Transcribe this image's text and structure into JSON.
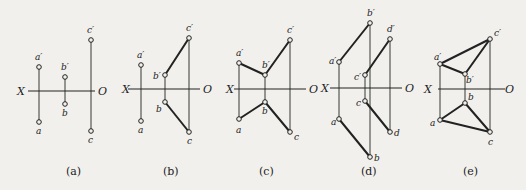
{
  "colors": {
    "background": "#f1f0ec",
    "ink": "#222222"
  },
  "panels": [
    {
      "id": "a",
      "caption": "(a)",
      "axis": {
        "x_label": "X",
        "o_label": "O",
        "y": 91,
        "x1": 28,
        "x2": 95,
        "xl": 17,
        "ol": 98
      },
      "points": [
        {
          "label": "a′",
          "x": 39,
          "y": 67,
          "lx": 35,
          "ly": 60
        },
        {
          "label": "a",
          "x": 39,
          "y": 122,
          "lx": 36,
          "ly": 134
        },
        {
          "label": "b′",
          "x": 65,
          "y": 77,
          "lx": 61,
          "ly": 70
        },
        {
          "label": "b",
          "x": 65,
          "y": 104,
          "lx": 62,
          "ly": 116
        },
        {
          "label": "c′",
          "x": 91,
          "y": 40,
          "lx": 87,
          "ly": 33
        },
        {
          "label": "c",
          "x": 91,
          "y": 131,
          "lx": 88,
          "ly": 143
        }
      ],
      "projectors": [
        [
          39,
          67,
          39,
          122
        ],
        [
          65,
          77,
          65,
          104
        ],
        [
          91,
          40,
          91,
          131
        ]
      ],
      "edges": [],
      "caption_pos": {
        "x": 66,
        "y": 175
      }
    },
    {
      "id": "b",
      "caption": "(b)",
      "axis": {
        "x_label": "X",
        "o_label": "O",
        "y": 89,
        "x1": 128,
        "x2": 200,
        "xl": 122,
        "ol": 203
      },
      "points": [
        {
          "label": "a′",
          "x": 141,
          "y": 65,
          "lx": 137,
          "ly": 58
        },
        {
          "label": "a",
          "x": 141,
          "y": 121,
          "lx": 138,
          "ly": 133
        },
        {
          "label": "b′",
          "x": 165,
          "y": 75,
          "lx": 153,
          "ly": 79
        },
        {
          "label": "b",
          "x": 165,
          "y": 102,
          "lx": 156,
          "ly": 112
        },
        {
          "label": "c′",
          "x": 189,
          "y": 38,
          "lx": 186,
          "ly": 31
        },
        {
          "label": "c",
          "x": 189,
          "y": 132,
          "lx": 187,
          "ly": 144
        }
      ],
      "projectors": [
        [
          141,
          65,
          141,
          121
        ],
        [
          165,
          75,
          165,
          102
        ],
        [
          189,
          38,
          189,
          132
        ]
      ],
      "edges": [
        [
          165,
          75,
          189,
          38
        ],
        [
          165,
          102,
          189,
          132
        ]
      ],
      "caption_pos": {
        "x": 163,
        "y": 175
      }
    },
    {
      "id": "c",
      "caption": "(c)",
      "axis": {
        "x_label": "X",
        "o_label": "O",
        "y": 89,
        "x1": 234,
        "x2": 306,
        "xl": 226,
        "ol": 309
      },
      "points": [
        {
          "label": "a′",
          "x": 239,
          "y": 63,
          "lx": 236,
          "ly": 56
        },
        {
          "label": "a",
          "x": 239,
          "y": 119,
          "lx": 236,
          "ly": 133
        },
        {
          "label": "b′",
          "x": 265,
          "y": 75,
          "lx": 262,
          "ly": 68
        },
        {
          "label": "b",
          "x": 265,
          "y": 102,
          "lx": 262,
          "ly": 114
        },
        {
          "label": "c′",
          "x": 290,
          "y": 40,
          "lx": 287,
          "ly": 33
        },
        {
          "label": "c",
          "x": 290,
          "y": 132,
          "lx": 294,
          "ly": 140
        }
      ],
      "projectors": [
        [
          239,
          63,
          239,
          119
        ],
        [
          265,
          75,
          265,
          102
        ],
        [
          290,
          40,
          290,
          132
        ]
      ],
      "edges": [
        [
          239,
          63,
          265,
          75
        ],
        [
          265,
          75,
          290,
          40
        ],
        [
          239,
          119,
          265,
          102
        ],
        [
          265,
          102,
          290,
          132
        ]
      ],
      "caption_pos": {
        "x": 259,
        "y": 175
      }
    },
    {
      "id": "d",
      "caption": "(d)",
      "axis": {
        "x_label": "X",
        "o_label": "O",
        "y": 88,
        "x1": 330,
        "x2": 402,
        "xl": 321,
        "ol": 405
      },
      "points": [
        {
          "label": "a′",
          "x": 339,
          "y": 62,
          "lx": 329,
          "ly": 64
        },
        {
          "label": "a",
          "x": 339,
          "y": 119,
          "lx": 331,
          "ly": 125
        },
        {
          "label": "b′",
          "x": 370,
          "y": 23,
          "lx": 367,
          "ly": 16
        },
        {
          "label": "b",
          "x": 370,
          "y": 157,
          "lx": 374,
          "ly": 161
        },
        {
          "label": "c′",
          "x": 365,
          "y": 75,
          "lx": 354,
          "ly": 80
        },
        {
          "label": "c",
          "x": 365,
          "y": 101,
          "lx": 356,
          "ly": 106
        },
        {
          "label": "d′",
          "x": 390,
          "y": 39,
          "lx": 387,
          "ly": 32
        },
        {
          "label": "d",
          "x": 390,
          "y": 132,
          "lx": 394,
          "ly": 136
        }
      ],
      "projectors": [
        [
          339,
          62,
          339,
          119
        ],
        [
          370,
          23,
          370,
          157
        ],
        [
          365,
          75,
          365,
          101
        ],
        [
          390,
          39,
          390,
          132
        ]
      ],
      "edges": [
        [
          339,
          62,
          370,
          23
        ],
        [
          339,
          119,
          370,
          157
        ],
        [
          365,
          75,
          390,
          39
        ],
        [
          365,
          101,
          390,
          132
        ]
      ],
      "caption_pos": {
        "x": 361,
        "y": 175
      }
    },
    {
      "id": "e",
      "caption": "(e)",
      "axis": {
        "x_label": "X",
        "o_label": "O",
        "y": 89,
        "x1": 438,
        "x2": 505,
        "xl": 424,
        "ol": 505
      },
      "points": [
        {
          "label": "a′",
          "x": 440,
          "y": 64,
          "lx": 434,
          "ly": 60
        },
        {
          "label": "a",
          "x": 440,
          "y": 120,
          "lx": 430,
          "ly": 126
        },
        {
          "label": "b′",
          "x": 465,
          "y": 74,
          "lx": 466,
          "ly": 83
        },
        {
          "label": "b",
          "x": 465,
          "y": 103,
          "lx": 468,
          "ly": 100
        },
        {
          "label": "c′",
          "x": 490,
          "y": 39,
          "lx": 494,
          "ly": 36
        },
        {
          "label": "c",
          "x": 490,
          "y": 132,
          "lx": 488,
          "ly": 145
        }
      ],
      "projectors": [
        [
          440,
          64,
          440,
          120
        ],
        [
          465,
          74,
          465,
          103
        ],
        [
          490,
          39,
          490,
          132
        ]
      ],
      "edges": [
        [
          440,
          64,
          490,
          39
        ],
        [
          440,
          64,
          465,
          74
        ],
        [
          465,
          74,
          490,
          39
        ],
        [
          440,
          120,
          465,
          103
        ],
        [
          465,
          103,
          490,
          132
        ],
        [
          440,
          120,
          490,
          132
        ]
      ],
      "caption_pos": {
        "x": 463,
        "y": 175
      }
    }
  ]
}
